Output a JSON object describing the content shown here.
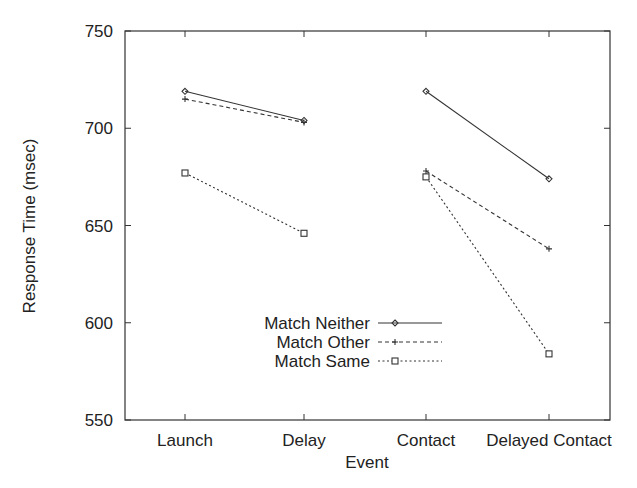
{
  "chart_data": {
    "type": "line",
    "title": "",
    "xlabel": "Event",
    "ylabel": "Response Time (msec)",
    "ylim": [
      550,
      750
    ],
    "yticks": [
      550,
      600,
      650,
      700,
      750
    ],
    "grid": false,
    "legend_position": "lower center, inside plot",
    "categories": [
      "Launch",
      "Delay",
      "Contact",
      "Delayed Contact"
    ],
    "segments_note": "Lines connect Launch-Delay and Contact-Delayed Contact only",
    "series": [
      {
        "name": "Match Neither",
        "marker": "diamond",
        "line": "solid",
        "values": [
          719,
          704,
          719,
          674
        ]
      },
      {
        "name": "Match Other",
        "marker": "plus",
        "line": "dashed",
        "values": [
          715,
          703,
          678,
          638
        ]
      },
      {
        "name": "Match Same",
        "marker": "square",
        "line": "dotted",
        "values": [
          677,
          646,
          675,
          584
        ]
      }
    ]
  },
  "axes": {
    "y_ticks": [
      "550",
      "600",
      "650",
      "700",
      "750"
    ],
    "x_ticks": [
      "Launch",
      "Delay",
      "Contact",
      "Delayed Contact"
    ],
    "x_title": "Event",
    "y_title": "Response Time (msec)"
  },
  "legend": {
    "items": [
      {
        "label": "Match Neither"
      },
      {
        "label": "Match Other"
      },
      {
        "label": "Match Same"
      }
    ]
  }
}
